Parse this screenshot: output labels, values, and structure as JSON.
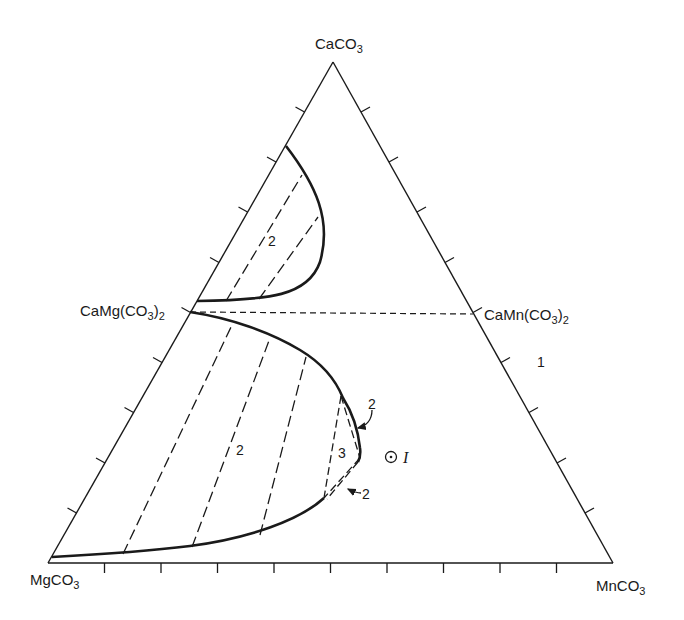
{
  "diagram": {
    "type": "ternary-phase-diagram",
    "vertices": {
      "top": {
        "formula": "CaCO",
        "sub": "3"
      },
      "bottom_left": {
        "formula": "MgCO",
        "sub": "3"
      },
      "bottom_right": {
        "formula": "MnCO",
        "sub": "3"
      }
    },
    "edge_compounds": {
      "left_mid": {
        "formula": "CaMg(CO",
        "sub1": "3",
        "close": ")",
        "sub2": "2"
      },
      "right_mid": {
        "formula": "CaMn(CO",
        "sub1": "3",
        "close": ")",
        "sub2": "2"
      }
    },
    "region_labels": {
      "single_phase": "1",
      "two_phase_upper": "2",
      "two_phase_lower": "2",
      "three_phase": "3",
      "two_phase_arrow_upper": "2",
      "two_phase_arrow_lower": "2"
    },
    "point": {
      "symbol": "⊙",
      "label": "I"
    },
    "ticks_per_edge": 5,
    "colors": {
      "line": "#1a1a1a",
      "background": "#ffffff"
    }
  }
}
